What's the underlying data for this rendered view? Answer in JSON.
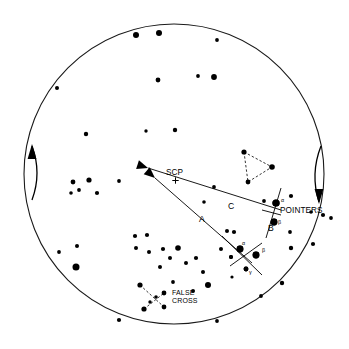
{
  "figure": {
    "background_color": "#ffffff",
    "ink_color": "#000000",
    "diameter_px": 300
  },
  "labels": {
    "scp": "SCP",
    "pointers": "POINTERS",
    "false_cross_line1": "FALSE",
    "false_cross_line2": "CROSS",
    "segment_a": "A",
    "segment_b": "B",
    "segment_c": "C",
    "alpha_pointers": "α",
    "beta_pointers": "β",
    "alpha_crux": "α",
    "beta_crux": "β",
    "gamma_crux": "γ"
  },
  "chart_data": {
    "type": "scatter",
    "xlabel": "",
    "ylabel": "",
    "xlim": [
      0,
      349
    ],
    "ylim": [
      0,
      349
    ],
    "grid": false,
    "legend": "none",
    "horizon": {
      "cx": 174,
      "cy": 174,
      "r": 150
    },
    "scp_marker": {
      "x": 175.5,
      "y": 180.5,
      "symbol": "+"
    },
    "stars": [
      {
        "x": 136,
        "y": 35,
        "r": 3.0
      },
      {
        "x": 159,
        "y": 33,
        "r": 3.0
      },
      {
        "x": 217,
        "y": 40,
        "r": 1.9
      },
      {
        "x": 57,
        "y": 88,
        "r": 2.0
      },
      {
        "x": 158,
        "y": 80,
        "r": 2.4
      },
      {
        "x": 198,
        "y": 76,
        "r": 1.9
      },
      {
        "x": 214,
        "y": 77,
        "r": 2.9
      },
      {
        "x": 86,
        "y": 134,
        "r": 2.2
      },
      {
        "x": 146,
        "y": 131,
        "r": 1.7
      },
      {
        "x": 175,
        "y": 130,
        "r": 2.2
      },
      {
        "x": 119,
        "y": 181,
        "r": 1.9
      },
      {
        "x": 73,
        "y": 182,
        "r": 2.4
      },
      {
        "x": 89,
        "y": 180,
        "r": 2.6
      },
      {
        "x": 71,
        "y": 193,
        "r": 1.8
      },
      {
        "x": 79,
        "y": 190,
        "r": 1.9
      },
      {
        "x": 97,
        "y": 193,
        "r": 2.1
      },
      {
        "x": 214,
        "y": 187,
        "r": 1.9
      },
      {
        "x": 204,
        "y": 202,
        "r": 1.8
      },
      {
        "x": 264,
        "y": 201,
        "r": 1.9
      },
      {
        "x": 291,
        "y": 196,
        "r": 2.1
      },
      {
        "x": 276,
        "y": 203,
        "r": 3.6
      },
      {
        "x": 274,
        "y": 222,
        "r": 3.4
      },
      {
        "x": 311,
        "y": 212,
        "r": 1.8
      },
      {
        "x": 323,
        "y": 215,
        "r": 2.1
      },
      {
        "x": 331,
        "y": 218,
        "r": 1.9
      },
      {
        "x": 290,
        "y": 232,
        "r": 1.9
      },
      {
        "x": 59,
        "y": 252,
        "r": 1.9
      },
      {
        "x": 77,
        "y": 246,
        "r": 2.0
      },
      {
        "x": 76,
        "y": 267,
        "r": 3.5
      },
      {
        "x": 135,
        "y": 236,
        "r": 2.1
      },
      {
        "x": 147,
        "y": 235,
        "r": 2.1
      },
      {
        "x": 136,
        "y": 248,
        "r": 2.0
      },
      {
        "x": 149,
        "y": 252,
        "r": 2.0
      },
      {
        "x": 163,
        "y": 249,
        "r": 2.1
      },
      {
        "x": 170,
        "y": 258,
        "r": 2.0
      },
      {
        "x": 178,
        "y": 248,
        "r": 2.8
      },
      {
        "x": 160,
        "y": 267,
        "r": 2.0
      },
      {
        "x": 186,
        "y": 263,
        "r": 2.0
      },
      {
        "x": 196,
        "y": 258,
        "r": 2.1
      },
      {
        "x": 203,
        "y": 272,
        "r": 2.0
      },
      {
        "x": 227,
        "y": 231,
        "r": 2.0
      },
      {
        "x": 234,
        "y": 232,
        "r": 2.1
      },
      {
        "x": 221,
        "y": 249,
        "r": 2.0
      },
      {
        "x": 231,
        "y": 257,
        "r": 2.0
      },
      {
        "x": 240,
        "y": 249,
        "r": 3.4
      },
      {
        "x": 256,
        "y": 255,
        "r": 3.4
      },
      {
        "x": 246,
        "y": 269,
        "r": 2.4
      },
      {
        "x": 291,
        "y": 248,
        "r": 2.2
      },
      {
        "x": 313,
        "y": 244,
        "r": 2.1
      },
      {
        "x": 282,
        "y": 283,
        "r": 2.2
      },
      {
        "x": 261,
        "y": 296,
        "r": 1.9
      },
      {
        "x": 208,
        "y": 285,
        "r": 3.0
      },
      {
        "x": 193,
        "y": 291,
        "r": 2.0
      },
      {
        "x": 173,
        "y": 282,
        "r": 1.9
      },
      {
        "x": 119,
        "y": 320,
        "r": 2.1
      },
      {
        "x": 217,
        "y": 321,
        "r": 1.9
      },
      {
        "x": 150,
        "y": 302,
        "r": 1.7
      },
      {
        "x": 232,
        "y": 277,
        "r": 1.6
      }
    ],
    "pointer_lines": [
      {
        "name": "line-A",
        "x1": 155,
        "y1": 178,
        "x2": 252,
        "y2": 263
      },
      {
        "name": "line-C",
        "x1": 148,
        "y1": 168,
        "x2": 281,
        "y2": 210
      }
    ],
    "arrowheads": [
      {
        "name": "arrowhead-A",
        "x": 155,
        "y": 178,
        "angle": 221
      },
      {
        "name": "arrowhead-C",
        "x": 148,
        "y": 168,
        "angle": 198
      }
    ],
    "segment_label_positions": {
      "A": {
        "x": 199,
        "y": 222
      },
      "B": {
        "x": 268,
        "y": 231
      },
      "C": {
        "x": 228,
        "y": 209
      }
    },
    "pointers_asterism": {
      "name": "POINTERS",
      "stars": [
        {
          "label": "α",
          "x": 276,
          "y": 203,
          "r": 3.6
        },
        {
          "label": "β",
          "x": 274,
          "y": 222,
          "r": 3.4
        }
      ],
      "guide_line": {
        "x1": 281,
        "y1": 188,
        "x2": 266,
        "y2": 238
      },
      "cross_line": {
        "x1": 262,
        "y1": 210,
        "x2": 281,
        "y2": 215
      }
    },
    "southern_cross_asterism": {
      "name": "Southern Cross (Crux)",
      "stars": [
        {
          "label": "α",
          "x": 240,
          "y": 249,
          "r": 3.4
        },
        {
          "label": "β",
          "x": 256,
          "y": 255,
          "r": 3.4
        },
        {
          "label": "γ",
          "x": 246,
          "y": 269,
          "r": 2.4
        },
        {
          "label": "",
          "x": 231,
          "y": 257,
          "r": 2.0
        }
      ],
      "bar1": {
        "x1": 222,
        "y1": 236,
        "x2": 262,
        "y2": 275
      },
      "bar2": {
        "x1": 230,
        "y1": 266,
        "x2": 262,
        "y2": 243
      }
    },
    "triangle_asterism": {
      "name": "Triangulum Australe",
      "style": "dashed",
      "stars": [
        {
          "x": 244,
          "y": 152,
          "r": 2.6
        },
        {
          "x": 272,
          "y": 167,
          "r": 2.8
        },
        {
          "x": 248,
          "y": 182,
          "r": 2.4
        }
      ]
    },
    "false_cross_asterism": {
      "name": "FALSE CROSS",
      "style": "dashed",
      "stars": [
        {
          "x": 140,
          "y": 285,
          "r": 2.6
        },
        {
          "x": 164,
          "y": 293,
          "r": 2.4
        },
        {
          "x": 144,
          "y": 309,
          "r": 2.6
        },
        {
          "x": 164,
          "y": 307,
          "r": 2.4
        },
        {
          "x": 156,
          "y": 297,
          "r": 1.8
        }
      ],
      "bar1": {
        "x1": 140,
        "y1": 285,
        "x2": 164,
        "y2": 307
      },
      "bar2": {
        "x1": 144,
        "y1": 309,
        "x2": 164,
        "y2": 293
      },
      "label_position": {
        "x": 172,
        "y": 295
      }
    },
    "rotation_arrows": [
      {
        "name": "left-rotation-arrow",
        "direction": "up",
        "x1": 32,
        "y1": 200,
        "x2": 32,
        "y2": 146
      },
      {
        "name": "right-rotation-arrow",
        "direction": "down",
        "x1": 321,
        "y1": 146,
        "x2": 319,
        "y2": 202
      }
    ]
  }
}
